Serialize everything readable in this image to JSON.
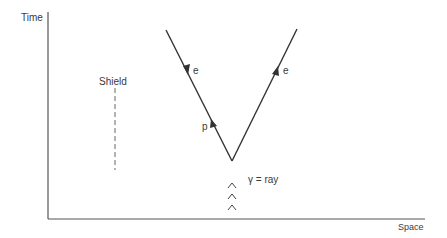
{
  "axes": {
    "y_label": "Time",
    "x_label": "Space"
  },
  "shield": {
    "label": "Shield"
  },
  "particles": {
    "left_upper": {
      "label": "e",
      "direction": "down"
    },
    "right_upper": {
      "label": "e",
      "direction": "up"
    },
    "left_lower": {
      "label": "p",
      "direction": "up"
    }
  },
  "gamma_ray": {
    "symbol": "γ",
    "label": "γ = ray",
    "markers": [
      "^",
      "^",
      "^"
    ]
  },
  "colors": {
    "line": "#3a3a3a",
    "text": "#3a3a3a",
    "background": "#ffffff"
  }
}
